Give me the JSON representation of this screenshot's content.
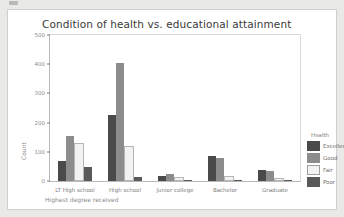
{
  "card": {
    "title": "Condition of health vs. educational attainment"
  },
  "legend": {
    "title": "Health"
  },
  "chart_data": {
    "type": "bar",
    "title": "Condition of health vs. educational attainment",
    "xlabel": "Highest degree received",
    "ylabel": "Count",
    "ylim": [
      0,
      500
    ],
    "yticks": [
      0,
      100,
      200,
      300,
      400,
      500
    ],
    "grid": false,
    "legend_title": "Health",
    "legend_position": "right",
    "categories": [
      "LT High school",
      "High school",
      "Junior college",
      "Bachelor",
      "Graduate"
    ],
    "series": [
      {
        "name": "Excellent",
        "color": "#4a4a4a",
        "values": [
          70,
          227,
          18,
          85,
          37
        ]
      },
      {
        "name": "Good",
        "color": "#8c8c8c",
        "values": [
          155,
          405,
          24,
          80,
          34
        ]
      },
      {
        "name": "Fair",
        "color": "#f2f2f0",
        "values": [
          122,
          113,
          6,
          11,
          3
        ]
      },
      {
        "name": "Poor",
        "color": "#595959",
        "values": [
          48,
          14,
          2,
          3,
          1
        ]
      }
    ]
  }
}
